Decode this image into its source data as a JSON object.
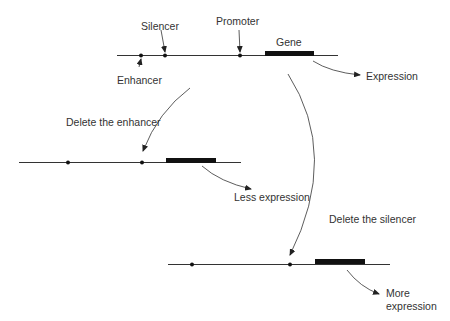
{
  "colors": {
    "line": "#333333",
    "gene": "#111111",
    "text": "#333333",
    "background": "#ffffff"
  },
  "top_construct": {
    "labels": {
      "silencer": "Silencer",
      "promoter": "Promoter",
      "gene": "Gene",
      "enhancer": "Enhancer",
      "expression": "Expression"
    }
  },
  "transitions": {
    "delete_enhancer": "Delete the enhancer",
    "delete_silencer": "Delete the silencer"
  },
  "middle_construct": {
    "result": "Less expression"
  },
  "bottom_construct": {
    "result_line1": "More",
    "result_line2": "expression"
  }
}
